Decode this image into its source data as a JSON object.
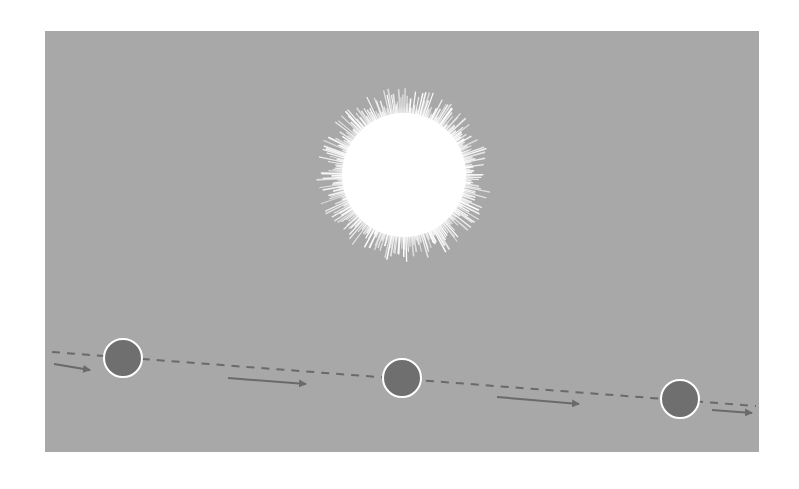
{
  "diagram": {
    "type": "planetary-transit-illustration",
    "colors": {
      "page_background": "#ffffff",
      "panel_background": "#a8a8a8",
      "sun": "#ffffff",
      "planet_fill": "#6f6f6f",
      "planet_outline": "#ffffff",
      "orbit_path": "#6a6a6a",
      "arrow": "#6a6a6a"
    },
    "panel": {
      "x": 45,
      "y": 31,
      "width": 714,
      "height": 421
    },
    "sun": {
      "cx": 404,
      "cy": 175,
      "r": 62,
      "ray_max": 84
    },
    "orbit_path": {
      "x1": 52,
      "y1": 352,
      "x2": 756,
      "y2": 406,
      "dash": "8,7"
    },
    "planets": [
      {
        "label": "planet-position-1",
        "cx": 123,
        "cy": 358,
        "r": 19
      },
      {
        "label": "planet-position-2",
        "cx": 402,
        "cy": 378,
        "r": 19
      },
      {
        "label": "planet-position-3",
        "cx": 680,
        "cy": 399,
        "r": 19
      }
    ],
    "arrows": [
      {
        "x1": 54,
        "y1": 364,
        "x2": 90,
        "y2": 370
      },
      {
        "x1": 228,
        "y1": 378,
        "x2": 306,
        "y2": 384
      },
      {
        "x1": 497,
        "y1": 397,
        "x2": 579,
        "y2": 404
      },
      {
        "x1": 712,
        "y1": 410,
        "x2": 752,
        "y2": 413
      }
    ]
  }
}
